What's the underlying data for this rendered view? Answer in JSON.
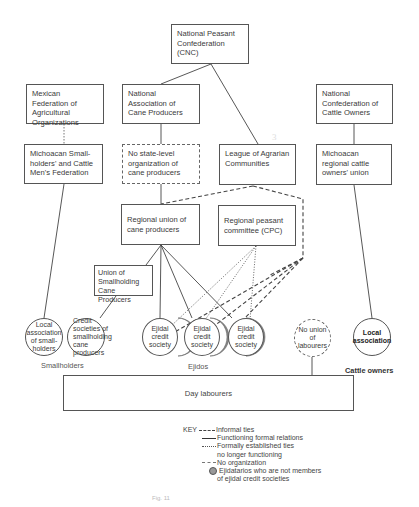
{
  "diagram": {
    "type": "organizational-chart",
    "nodes": {
      "cnc": "National Peasant Confederation (CNC)",
      "mexican_federation": "Mexican Federation of Agricultural Organizations",
      "national_cane": "National Association of Cane Producers",
      "national_cattle": "National Confederation of Cattle Owners",
      "michoacan_smallholders": "Michoacan Small-holders' and Cattle Men's Federation",
      "no_state_level": "No state-level organization of cane producers",
      "league": "League of Agrarian Communities",
      "michoacan_cattle": "Michoacan regional cattle owners' union",
      "regional_cane_union": "Regional union of cane producers",
      "regional_peasant_committee": "Regional peasant committee (CPC)",
      "union_smallholding_cane": "Union of Smallholding Cane Producers",
      "local_smallholders": "Local association of small-holders",
      "credit_smallholding": "Credit societies of smallholding cane producers",
      "ejidal_1": "Ejidal credit society",
      "ejidal_2": "Ejidal credit society",
      "ejidal_3": "Ejidal credit society",
      "no_union_labourers": "No union of labourers",
      "local_association": "Local association",
      "day_labourers": "Day labourers"
    },
    "group_labels": {
      "smallholders": "Smallholders",
      "ejidos": "Ejidos",
      "cattle_owners": "Cattle owners"
    },
    "edges": [
      {
        "from": "cnc",
        "to": "national_cane",
        "style": "solid"
      },
      {
        "from": "cnc",
        "to": "league",
        "style": "solid"
      },
      {
        "from": "mexican_federation",
        "to": "michoacan_smallholders",
        "style": "no-organization"
      },
      {
        "from": "national_cane",
        "to": "no_state_level",
        "style": "solid"
      },
      {
        "from": "national_cattle",
        "to": "michoacan_cattle",
        "style": "solid"
      },
      {
        "from": "michoacan_smallholders",
        "to": "local_smallholders",
        "style": "solid"
      },
      {
        "from": "no_state_level",
        "to": "regional_cane_union",
        "style": "solid"
      },
      {
        "from": "league",
        "to": "regional_cane_union",
        "style": "informal"
      },
      {
        "from": "league",
        "to": "ejidal_1",
        "style": "informal"
      },
      {
        "from": "league",
        "to": "ejidal_2",
        "style": "informal"
      },
      {
        "from": "league",
        "to": "ejidal_3",
        "style": "informal"
      },
      {
        "from": "regional_cane_union",
        "to": "union_smallholding_cane",
        "style": "solid"
      },
      {
        "from": "regional_cane_union",
        "to": "ejidal_1",
        "style": "solid"
      },
      {
        "from": "regional_cane_union",
        "to": "ejidal_2",
        "style": "solid"
      },
      {
        "from": "regional_cane_union",
        "to": "ejidal_3",
        "style": "solid"
      },
      {
        "from": "regional_peasant_committee",
        "to": "ejidal_1",
        "style": "formal-not-functioning"
      },
      {
        "from": "regional_peasant_committee",
        "to": "ejidal_2",
        "style": "formal-not-functioning"
      },
      {
        "from": "regional_peasant_committee",
        "to": "ejidal_3",
        "style": "formal-not-functioning"
      },
      {
        "from": "union_smallholding_cane",
        "to": "credit_smallholding",
        "style": "solid"
      },
      {
        "from": "michoacan_cattle",
        "to": "local_association",
        "style": "solid"
      },
      {
        "from": "no_union_labourers",
        "to": "day_labourers",
        "style": "solid"
      }
    ],
    "annotation_mark": "3"
  },
  "key": {
    "title": "KEY",
    "entries": [
      {
        "style": "informal",
        "label": "Informal ties"
      },
      {
        "style": "solid",
        "label": "Functioning formal relations"
      },
      {
        "style": "formal-not-functioning",
        "label": "Formally established ties",
        "label2": "no longer functioning"
      },
      {
        "style": "no-organization",
        "label": "No organization"
      },
      {
        "style": "shaded-crescent",
        "label": "Ejidatarios who are not members",
        "label2": "of ejidal credit societies"
      }
    ]
  },
  "caption": "Fig. 11"
}
